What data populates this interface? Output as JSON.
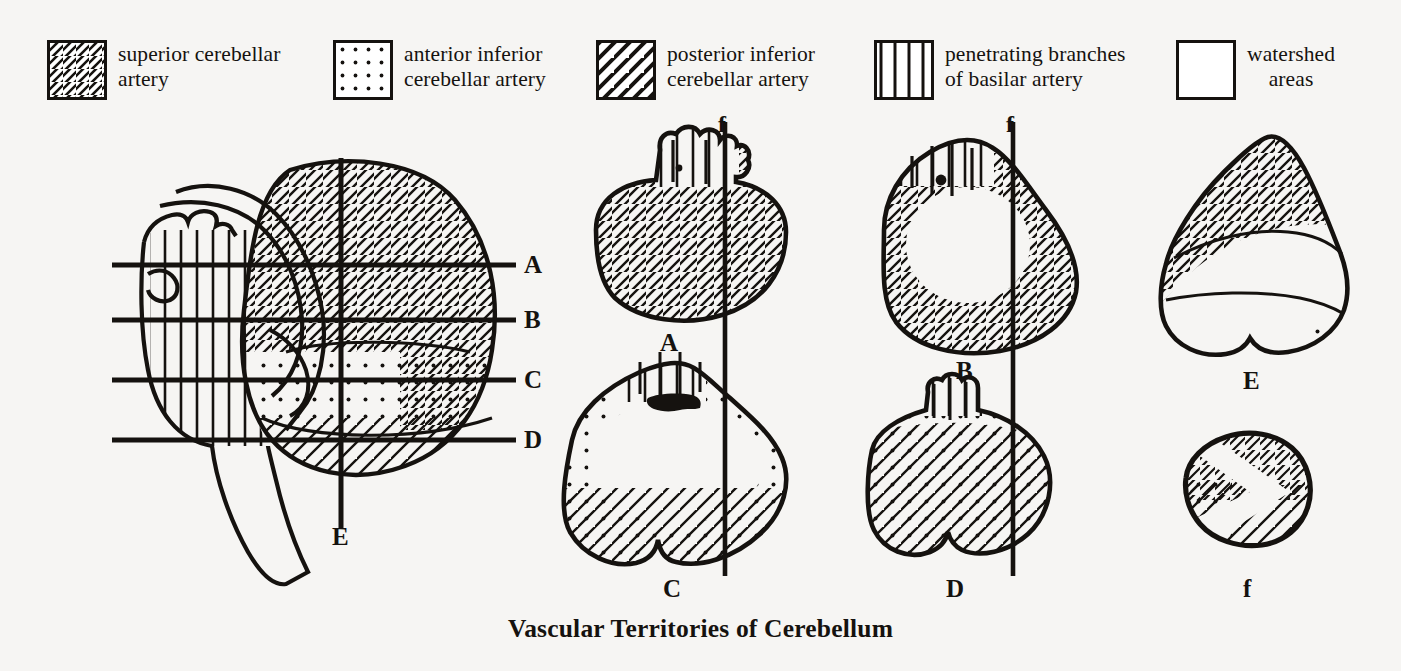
{
  "figure": {
    "title": "Vascular Territories of Cerebellum",
    "ink_color": "#15120f",
    "paper_color": "#f6f5f3"
  },
  "legend": {
    "items": [
      {
        "id": "sca",
        "pattern": "diagonal-backslash",
        "label": "superior cerebellar\nartery",
        "align": "left"
      },
      {
        "id": "aica",
        "pattern": "dots",
        "label": "anterior inferior\ncerebellar artery",
        "align": "left"
      },
      {
        "id": "pica",
        "pattern": "diagonal-slash",
        "label": "posterior inferior\ncerebellar artery",
        "align": "left"
      },
      {
        "id": "basilar",
        "pattern": "vertical-lines",
        "label": "penetrating branches\nof basilar artery",
        "align": "left"
      },
      {
        "id": "watershed",
        "pattern": "blank",
        "label": "watershed\nareas",
        "align": "center"
      }
    ]
  },
  "lateral_view": {
    "caption": "E",
    "section_lines": [
      {
        "label": "A",
        "y": 265
      },
      {
        "label": "B",
        "y": 320
      },
      {
        "label": "C",
        "y": 380
      },
      {
        "label": "D",
        "y": 440
      }
    ]
  },
  "sections": [
    {
      "id": "A",
      "caption": "A",
      "territories": [
        "sca",
        "basilar"
      ],
      "f_line": true
    },
    {
      "id": "B",
      "caption": "B",
      "territories": [
        "sca",
        "basilar",
        "watershed"
      ],
      "f_line": true
    },
    {
      "id": "C",
      "caption": "C",
      "territories": [
        "aica",
        "pica",
        "basilar",
        "watershed"
      ],
      "f_line": true
    },
    {
      "id": "D",
      "caption": "D",
      "territories": [
        "aica",
        "pica",
        "basilar"
      ],
      "f_line": true
    },
    {
      "id": "E",
      "caption": "E",
      "territories": [
        "sca",
        "pica",
        "aica",
        "watershed"
      ],
      "f_line": false
    },
    {
      "id": "f",
      "caption": "f",
      "territories": [
        "sca",
        "pica",
        "aica"
      ],
      "f_line": false
    }
  ],
  "f_lines": [
    {
      "label": "f",
      "x": 725
    },
    {
      "label": "f",
      "x": 1013
    }
  ]
}
